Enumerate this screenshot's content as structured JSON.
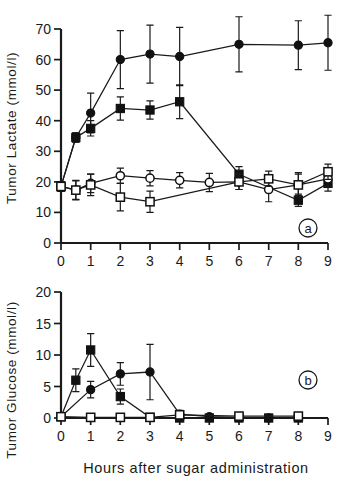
{
  "figure": {
    "xlabel": "Hours after sugar  administration",
    "panel_a_tag": "a",
    "panel_b_tag": "b"
  },
  "panel_a": {
    "ylabel": "Tumor Lactate  (mmol/l)",
    "yticks": [
      "0",
      "10",
      "20",
      "30",
      "40",
      "50",
      "60",
      "70"
    ],
    "xticks": [
      "0",
      "1",
      "2",
      "3",
      "4",
      "5",
      "6",
      "7",
      "8",
      "9"
    ]
  },
  "panel_b": {
    "ylabel": "Tumor Glucose  (mmol/l)",
    "yticks": [
      "0",
      "5",
      "10",
      "15",
      "20"
    ],
    "xticks": [
      "0",
      "1",
      "2",
      "3",
      "4",
      "5",
      "6",
      "7",
      "8",
      "9"
    ]
  },
  "chart_data": [
    {
      "type": "line",
      "panel": "a",
      "title": "Tumor Lactate vs. time after sugar administration",
      "xlabel": "Hours after sugar administration",
      "ylabel": "Tumor Lactate (mmol/l)",
      "xlim": [
        0,
        9
      ],
      "ylim": [
        0,
        70
      ],
      "xticks": [
        0,
        1,
        2,
        3,
        4,
        5,
        6,
        7,
        8,
        9
      ],
      "yticks": [
        0,
        10,
        20,
        30,
        40,
        50,
        60,
        70
      ],
      "grid": false,
      "legend": "none",
      "errorbars": "mean +/- SD",
      "series": [
        {
          "name": "filled-circle",
          "marker": "filled circle",
          "x": [
            0,
            0.5,
            1,
            2,
            3,
            4,
            6,
            8,
            9
          ],
          "values": [
            18.5,
            34.5,
            42.5,
            60.0,
            61.8,
            61.0,
            65.0,
            64.7,
            65.5
          ],
          "err": [
            1.5,
            1.5,
            6.5,
            9.5,
            9.5,
            9.5,
            9.0,
            8.0,
            9.0
          ]
        },
        {
          "name": "filled-square",
          "marker": "filled square",
          "x": [
            0,
            0.5,
            1,
            2,
            3,
            4,
            6,
            8,
            9
          ],
          "values": [
            18.5,
            34.5,
            37.5,
            44.0,
            43.5,
            46.2,
            22.5,
            14.0,
            19.5
          ],
          "err": [
            1.5,
            1.5,
            2.5,
            3.8,
            3.0,
            5.5,
            2.5,
            2.0,
            2.5
          ]
        },
        {
          "name": "open-circle",
          "marker": "open circle",
          "x": [
            0,
            0.5,
            1,
            2,
            3,
            4,
            5,
            6,
            7,
            8,
            9
          ],
          "values": [
            18.5,
            17.3,
            19.5,
            22.0,
            21.2,
            20.5,
            19.8,
            20.0,
            17.5,
            19.0,
            21.0
          ],
          "err": [
            1.5,
            3.0,
            3.0,
            2.5,
            2.5,
            2.5,
            3.0,
            2.5,
            4.0,
            3.5,
            2.5
          ]
        },
        {
          "name": "open-square",
          "marker": "open square",
          "x": [
            0,
            0.5,
            1,
            2,
            3,
            6,
            7,
            8,
            9
          ],
          "values": [
            18.5,
            17.3,
            19.0,
            15.0,
            13.5,
            20.0,
            21.0,
            19.0,
            23.3
          ],
          "err": [
            1.5,
            3.2,
            3.5,
            4.5,
            3.5,
            2.5,
            2.5,
            4.0,
            2.5
          ]
        }
      ]
    },
    {
      "type": "line",
      "panel": "b",
      "title": "Tumor Glucose vs. time after sugar administration",
      "xlabel": "Hours after sugar administration",
      "ylabel": "Tumor Glucose (mmol/l)",
      "xlim": [
        0,
        9
      ],
      "ylim": [
        0,
        20
      ],
      "xticks": [
        0,
        1,
        2,
        3,
        4,
        5,
        6,
        7,
        8,
        9
      ],
      "yticks": [
        0,
        5,
        10,
        15,
        20
      ],
      "grid": false,
      "legend": "none",
      "errorbars": "mean +/- SD",
      "series": [
        {
          "name": "filled-square",
          "marker": "filled square",
          "x": [
            0,
            0.5,
            1,
            2,
            3,
            4,
            5,
            6,
            7,
            8
          ],
          "values": [
            0.2,
            6.0,
            10.8,
            3.4,
            0.1,
            0.0,
            0.0,
            0.0,
            0.0,
            0.0
          ],
          "err": [
            0.0,
            1.8,
            2.6,
            1.2,
            0.3,
            0.2,
            0.1,
            0.1,
            0.1,
            0.1
          ]
        },
        {
          "name": "filled-circle",
          "marker": "filled circle",
          "x": [
            0,
            1,
            2,
            3,
            4,
            5,
            6,
            7,
            8
          ],
          "values": [
            0.2,
            4.5,
            7.0,
            7.3,
            0.6,
            0.2,
            0.1,
            0.0,
            0.1
          ],
          "err": [
            0.0,
            1.3,
            1.8,
            4.4,
            0.6,
            0.2,
            0.1,
            0.1,
            0.1
          ]
        },
        {
          "name": "open-square",
          "marker": "open square",
          "x": [
            0,
            1,
            2,
            3,
            4,
            6,
            8
          ],
          "values": [
            0.2,
            0.1,
            0.1,
            0.1,
            0.5,
            0.3,
            0.3
          ],
          "err": [
            0.0,
            0.0,
            0.0,
            0.0,
            0.6,
            0.1,
            0.1
          ]
        }
      ]
    }
  ]
}
